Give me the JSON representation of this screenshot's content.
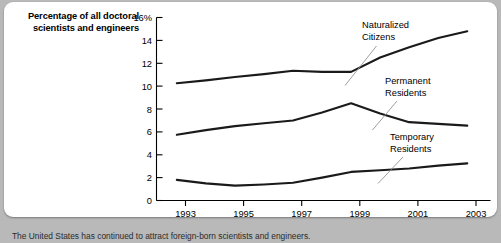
{
  "card": {
    "background_color": "#ffffff",
    "page_background_color": "#b9b9b9"
  },
  "title": {
    "line1": "Percentage of all doctoral",
    "line2": "scientists and engineers"
  },
  "caption": {
    "text": "The United States has continued to attract foreign-born scientists and engineers."
  },
  "chart_data": {
    "type": "line",
    "title": "Percentage of all doctoral scientists and engineers",
    "xlabel": "",
    "ylabel": "Percentage of all doctoral scientists and engineers",
    "x": [
      1993,
      1994,
      1995,
      1996,
      1997,
      1998,
      1999,
      2000,
      2001,
      2002,
      2003
    ],
    "xtick_labels": [
      "1993",
      "1995",
      "1997",
      "1999",
      "2001",
      "2003"
    ],
    "xtick_values": [
      1993,
      1995,
      1997,
      1999,
      2001,
      2003
    ],
    "xlim": [
      1992.3,
      2003.8
    ],
    "ylim": [
      0,
      16
    ],
    "ytick_labels": [
      "0",
      "2",
      "4",
      "6",
      "8",
      "10",
      "12",
      "14",
      "16%"
    ],
    "ytick_values": [
      0,
      2,
      4,
      6,
      8,
      10,
      12,
      14,
      16
    ],
    "grid": false,
    "legend": "annotations",
    "line_color": "#1a1a1a",
    "series": [
      {
        "name": "Naturalized Citizens",
        "values": [
          10.25,
          10.5,
          10.8,
          11.05,
          11.35,
          11.25,
          11.25,
          12.5,
          13.4,
          14.2,
          14.8
        ]
      },
      {
        "name": "Permanent Residents",
        "values": [
          5.75,
          6.15,
          6.5,
          6.75,
          7.0,
          7.7,
          8.5,
          7.6,
          6.85,
          6.7,
          6.55
        ]
      },
      {
        "name": "Temporary Residents",
        "values": [
          1.8,
          1.5,
          1.3,
          1.4,
          1.55,
          2.0,
          2.5,
          2.65,
          2.8,
          3.05,
          3.25
        ]
      }
    ],
    "annotations": [
      {
        "name": "Naturalized Citizens",
        "line1": "Naturalized",
        "line2": "Citizens"
      },
      {
        "name": "Permanent Residents",
        "line1": "Permanent",
        "line2": "Residents"
      },
      {
        "name": "Temporary Residents",
        "line1": "Temporary",
        "line2": "Residents"
      }
    ]
  }
}
